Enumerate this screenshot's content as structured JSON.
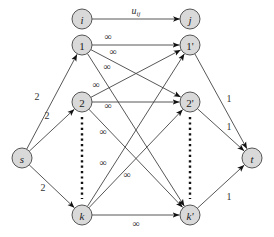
{
  "diagram": {
    "type": "flow-network",
    "legend": {
      "from": "i",
      "to": "j",
      "label": "u_ij",
      "label_main": "u",
      "label_sub": "ij"
    },
    "nodes": [
      {
        "id": "i",
        "label": "i",
        "italic": true
      },
      {
        "id": "j",
        "label": "j",
        "italic": true
      },
      {
        "id": "1",
        "label": "1",
        "italic": false
      },
      {
        "id": "2",
        "label": "2",
        "italic": false
      },
      {
        "id": "k",
        "label": "k",
        "italic": true
      },
      {
        "id": "1p",
        "label": "1'",
        "italic": false
      },
      {
        "id": "2p",
        "label": "2'",
        "italic": false
      },
      {
        "id": "kp",
        "label": "k'",
        "italic": true
      },
      {
        "id": "s",
        "label": "s",
        "italic": true
      },
      {
        "id": "t",
        "label": "t",
        "italic": true
      }
    ],
    "edges": [
      {
        "from": "s",
        "to": "1",
        "label": "2"
      },
      {
        "from": "s",
        "to": "2",
        "label": "2"
      },
      {
        "from": "s",
        "to": "k",
        "label": "2"
      },
      {
        "from": "1",
        "to": "1p",
        "label": "∞"
      },
      {
        "from": "1",
        "to": "2p",
        "label": "∞"
      },
      {
        "from": "1",
        "to": "kp",
        "label": "∞"
      },
      {
        "from": "2",
        "to": "1p",
        "label": "∞"
      },
      {
        "from": "2",
        "to": "2p",
        "label": "∞"
      },
      {
        "from": "2",
        "to": "kp",
        "label": "∞"
      },
      {
        "from": "k",
        "to": "1p",
        "label": "∞"
      },
      {
        "from": "k",
        "to": "2p",
        "label": "∞"
      },
      {
        "from": "k",
        "to": "kp",
        "label": "∞"
      },
      {
        "from": "1p",
        "to": "t",
        "label": "1"
      },
      {
        "from": "2p",
        "to": "t",
        "label": "1"
      },
      {
        "from": "kp",
        "to": "t",
        "label": "1"
      }
    ],
    "ellipsis": [
      "left-column",
      "right-column"
    ]
  }
}
